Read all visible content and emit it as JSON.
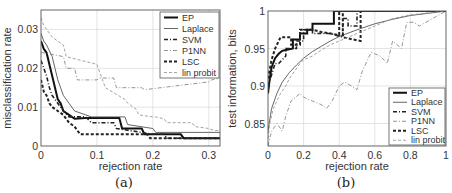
{
  "chart_data": [
    {
      "panel": "a",
      "caption": "(a)",
      "type": "line",
      "title": "",
      "xlabel": "rejection rate",
      "ylabel": "misclassification rate",
      "xlim": [
        0,
        0.32
      ],
      "ylim": [
        0,
        0.035
      ],
      "xticks": [
        0,
        0.1,
        0.2,
        0.3
      ],
      "xtick_labels": [
        "0",
        "0.1",
        "0.2",
        "0.3"
      ],
      "yticks": [
        0,
        0.01,
        0.02,
        0.03
      ],
      "ytick_labels": [
        "0",
        "0.01",
        "0.02",
        "0.03"
      ],
      "grid": true,
      "legend_position": "upper right",
      "series": [
        {
          "name": "EP",
          "style": "solid-thick",
          "x": [
            0,
            0.005,
            0.01,
            0.015,
            0.02,
            0.025,
            0.03,
            0.035,
            0.04,
            0.05,
            0.06,
            0.08,
            0.1,
            0.14,
            0.145,
            0.18,
            0.185,
            0.25,
            0.255,
            0.32
          ],
          "y": [
            0.027,
            0.025,
            0.024,
            0.021,
            0.018,
            0.015,
            0.012,
            0.011,
            0.009,
            0.008,
            0.007,
            0.0072,
            0.0072,
            0.0072,
            0.0045,
            0.0045,
            0.003,
            0.003,
            0.002,
            0.002
          ]
        },
        {
          "name": "Laplace",
          "style": "solid-thin",
          "x": [
            0,
            0.005,
            0.01,
            0.02,
            0.025,
            0.03,
            0.04,
            0.05,
            0.06,
            0.08,
            0.09,
            0.15,
            0.155,
            0.2,
            0.205,
            0.3,
            0.32
          ],
          "y": [
            0.029,
            0.027,
            0.026,
            0.023,
            0.02,
            0.017,
            0.013,
            0.011,
            0.009,
            0.008,
            0.0075,
            0.0075,
            0.0055,
            0.0045,
            0.0035,
            0.0035,
            0.0035
          ]
        },
        {
          "name": "SVM",
          "style": "dash-dot",
          "x": [
            0,
            0.005,
            0.01,
            0.015,
            0.02,
            0.03,
            0.04,
            0.05,
            0.08,
            0.09,
            0.13,
            0.135,
            0.18,
            0.2,
            0.22,
            0.225,
            0.32
          ],
          "y": [
            0.022,
            0.02,
            0.018,
            0.015,
            0.013,
            0.011,
            0.009,
            0.0075,
            0.0075,
            0.006,
            0.006,
            0.0045,
            0.0035,
            0.003,
            0.003,
            0.002,
            0.002
          ]
        },
        {
          "name": "P1NN",
          "style": "dash-dot-light",
          "x": [
            0,
            0.003,
            0.04,
            0.045,
            0.06,
            0.065,
            0.1,
            0.105,
            0.13,
            0.135,
            0.18,
            0.185,
            0.3,
            0.305,
            0.32
          ],
          "y": [
            0.024,
            0.024,
            0.023,
            0.02,
            0.02,
            0.017,
            0.017,
            0.0175,
            0.0175,
            0.015,
            0.015,
            0.0145,
            0.0165,
            0.017,
            0.0175
          ]
        },
        {
          "name": "LSC",
          "style": "dashed-thick",
          "x": [
            0,
            0.005,
            0.01,
            0.015,
            0.02,
            0.03,
            0.04,
            0.05,
            0.06,
            0.065,
            0.07,
            0.18,
            0.19,
            0.195,
            0.32
          ],
          "y": [
            0.017,
            0.014,
            0.013,
            0.011,
            0.01,
            0.009,
            0.008,
            0.006,
            0.005,
            0.004,
            0.003,
            0.003,
            0.003,
            0.002,
            0.002
          ]
        },
        {
          "name": "lin probit",
          "style": "dashed-light",
          "x": [
            0,
            0.005,
            0.01,
            0.02,
            0.04,
            0.045,
            0.1,
            0.105,
            0.11,
            0.115,
            0.15,
            0.155,
            0.17,
            0.175,
            0.2,
            0.205,
            0.22,
            0.225,
            0.27,
            0.275,
            0.3,
            0.31,
            0.32
          ],
          "y": [
            0.033,
            0.031,
            0.03,
            0.028,
            0.026,
            0.023,
            0.021,
            0.019,
            0.017,
            0.015,
            0.012,
            0.011,
            0.0095,
            0.008,
            0.0075,
            0.0075,
            0.007,
            0.006,
            0.006,
            0.005,
            0.0045,
            0.004,
            0.004
          ]
        }
      ]
    },
    {
      "panel": "b",
      "caption": "(b)",
      "type": "line",
      "title": "",
      "xlabel": "rejection rate",
      "ylabel": "test information, bits",
      "xlim": [
        0,
        1
      ],
      "ylim": [
        0.82,
        1
      ],
      "xticks": [
        0,
        0.2,
        0.4,
        0.6,
        0.8,
        1
      ],
      "xtick_labels": [
        "0",
        "0.2",
        "0.4",
        "0.6",
        "0.8",
        "1"
      ],
      "yticks": [
        0.85,
        0.9,
        0.95,
        1
      ],
      "ytick_labels": [
        "0.85",
        "0.9",
        "0.95",
        "1"
      ],
      "grid": true,
      "legend_position": "lower right",
      "series": [
        {
          "name": "EP",
          "style": "solid-thick",
          "x": [
            0,
            0.01,
            0.02,
            0.04,
            0.06,
            0.08,
            0.1,
            0.14,
            0.14,
            0.18,
            0.18,
            0.22,
            0.22,
            0.25,
            0.25,
            0.3,
            0.37,
            0.37,
            0.4,
            0.6,
            1
          ],
          "y": [
            0.89,
            0.91,
            0.925,
            0.937,
            0.943,
            0.947,
            0.948,
            0.95,
            0.962,
            0.962,
            0.97,
            0.97,
            0.975,
            0.975,
            0.983,
            0.983,
            0.983,
            1,
            1,
            1,
            1
          ]
        },
        {
          "name": "Laplace",
          "style": "solid-thin",
          "x": [
            0,
            0.02,
            0.05,
            0.08,
            0.12,
            0.16,
            0.2,
            0.25,
            0.3,
            0.35,
            0.4,
            0.5,
            0.6,
            0.7,
            0.8,
            0.9,
            1
          ],
          "y": [
            0.84,
            0.87,
            0.89,
            0.905,
            0.918,
            0.928,
            0.937,
            0.946,
            0.953,
            0.96,
            0.966,
            0.975,
            0.983,
            0.989,
            0.994,
            0.997,
            1
          ]
        },
        {
          "name": "SVM",
          "style": "dash-dot",
          "x": [
            0,
            0.02,
            0.04,
            0.06,
            0.08,
            0.1,
            0.1,
            0.16,
            0.16,
            0.2,
            0.2,
            0.25,
            0.25,
            0.35,
            0.42,
            0.42,
            0.45,
            0.45,
            0.5,
            0.5,
            1
          ],
          "y": [
            0.9,
            0.915,
            0.93,
            0.93,
            0.935,
            0.94,
            0.95,
            0.95,
            0.96,
            0.96,
            0.975,
            0.975,
            0.97,
            0.97,
            0.965,
            0.99,
            0.99,
            0.98,
            0.98,
            1,
            1
          ]
        },
        {
          "name": "P1NN",
          "style": "dash-dot-light",
          "x": [
            0,
            0.02,
            0.05,
            0.08,
            0.1,
            0.13,
            0.18,
            0.2,
            0.25,
            0.3,
            0.33,
            0.36,
            0.4,
            0.43,
            0.47,
            0.5,
            0.53,
            0.58,
            0.63,
            0.67,
            0.7,
            0.75,
            0.78,
            0.82,
            0.85,
            1
          ],
          "y": [
            0.82,
            0.84,
            0.85,
            0.84,
            0.86,
            0.88,
            0.89,
            0.885,
            0.88,
            0.875,
            0.87,
            0.88,
            0.9,
            0.905,
            0.9,
            0.895,
            0.92,
            0.945,
            0.94,
            0.93,
            0.96,
            0.95,
            0.985,
            0.985,
            0.98,
            1
          ]
        },
        {
          "name": "LSC",
          "style": "dashed-thick",
          "x": [
            0,
            0.02,
            0.04,
            0.07,
            0.07,
            0.13,
            0.13,
            0.18,
            0.18,
            0.25,
            0.3,
            0.35,
            0.4,
            0.4,
            0.42,
            0.42,
            0.52,
            0.52,
            0.6,
            1
          ],
          "y": [
            0.91,
            0.935,
            0.95,
            0.965,
            0.965,
            0.965,
            0.955,
            0.955,
            0.975,
            0.975,
            0.972,
            0.97,
            0.968,
            1,
            1,
            0.965,
            0.96,
            1,
            1,
            1
          ]
        },
        {
          "name": "lin probit",
          "style": "dashed-light",
          "x": [
            0,
            0.01,
            0.03,
            0.05,
            0.07,
            0.1,
            0.12,
            0.15,
            0.18,
            0.2,
            0.25,
            0.3,
            0.35,
            0.4,
            0.45,
            0.5,
            0.55,
            0.6,
            0.7,
            0.8,
            1
          ],
          "y": [
            0.83,
            0.85,
            0.87,
            0.88,
            0.89,
            0.9,
            0.91,
            0.92,
            0.93,
            0.935,
            0.94,
            0.948,
            0.955,
            0.96,
            0.965,
            0.97,
            0.975,
            0.98,
            0.99,
            0.995,
            1
          ]
        }
      ]
    }
  ],
  "legend": {
    "entries": [
      "EP",
      "Laplace",
      "SVM",
      "P1NN",
      "LSC",
      "lin probit"
    ]
  },
  "styles": {
    "solid-thick": {
      "color": "#111111",
      "width": 2.0,
      "dash": ""
    },
    "solid-thin": {
      "color": "#555555",
      "width": 0.9,
      "dash": ""
    },
    "dash-dot": {
      "color": "#222222",
      "width": 1.6,
      "dash": "4,2,1,2"
    },
    "dash-dot-light": {
      "color": "#888888",
      "width": 0.9,
      "dash": "4,2,1,2"
    },
    "dashed-thick": {
      "color": "#222222",
      "width": 2.0,
      "dash": "3,2"
    },
    "dashed-light": {
      "color": "#999999",
      "width": 0.9,
      "dash": "3,2"
    }
  }
}
